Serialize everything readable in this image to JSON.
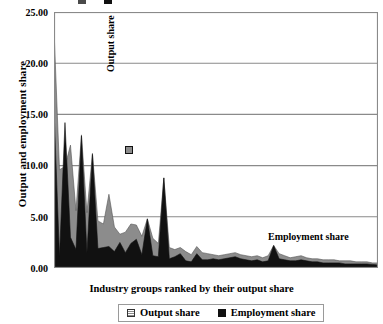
{
  "figure": {
    "top_remnant": {
      "swatch_1_color": "#4a4a4a",
      "swatch_2_color": "#111111"
    }
  },
  "axes": {
    "ylabel": "Output and employment share",
    "xlabel": "Industry groups ranked by their output share",
    "ytick_labels": [
      "25.00",
      "20.00",
      "15.00",
      "10.00",
      "5.00",
      "0.00"
    ]
  },
  "annotations": {
    "output_share": "Output share",
    "employment_share": "Employment share"
  },
  "legend": {
    "items": [
      {
        "label": "Output share",
        "color": "#8c8c8c"
      },
      {
        "label": "Employment share",
        "color": "#111111"
      }
    ]
  },
  "chart_data": {
    "type": "area",
    "title": "",
    "subtitle": "",
    "xlabel": "Industry groups ranked by their output share",
    "ylabel": "Output and employment share",
    "ylim": [
      0,
      25
    ],
    "xlim": [
      0,
      59
    ],
    "ytick_step": 5,
    "ytick_values": [
      0,
      5,
      10,
      15,
      20,
      25
    ],
    "grid": "horizontal",
    "legend_position": "below-plot-center",
    "x": [
      0,
      1,
      2,
      3,
      4,
      5,
      6,
      7,
      8,
      9,
      10,
      11,
      12,
      13,
      14,
      15,
      16,
      17,
      18,
      19,
      20,
      21,
      22,
      23,
      24,
      25,
      26,
      27,
      28,
      29,
      30,
      31,
      32,
      33,
      34,
      35,
      36,
      37,
      38,
      39,
      40,
      41,
      42,
      43,
      44,
      45,
      46,
      47,
      48,
      49,
      50,
      51,
      52,
      53,
      54,
      55,
      56,
      57,
      58,
      59
    ],
    "series": [
      {
        "name": "Output share",
        "color": "#8c8c8c",
        "values": [
          23.3,
          9.6,
          9.9,
          12.0,
          5.6,
          13.0,
          5.4,
          11.2,
          4.6,
          4.3,
          7.2,
          4.0,
          3.3,
          3.5,
          4.3,
          4.2,
          3.1,
          4.8,
          2.9,
          2.4,
          8.8,
          2.0,
          1.8,
          2.0,
          1.6,
          1.3,
          2.1,
          1.5,
          1.4,
          1.3,
          1.2,
          1.3,
          1.4,
          1.5,
          1.3,
          1.2,
          1.1,
          1.2,
          1.0,
          1.2,
          2.2,
          1.4,
          1.2,
          1.0,
          1.1,
          1.2,
          1.0,
          0.9,
          0.9,
          0.8,
          0.8,
          0.8,
          0.7,
          0.7,
          0.7,
          0.6,
          0.6,
          0.6,
          0.5,
          0.5
        ]
      },
      {
        "name": "Employment share",
        "color": "#111111",
        "values": [
          15.5,
          1.1,
          14.2,
          3.0,
          1.8,
          12.9,
          1.5,
          11.1,
          1.9,
          2.0,
          2.1,
          1.6,
          2.5,
          1.5,
          2.4,
          2.8,
          1.3,
          4.8,
          1.2,
          1.1,
          8.8,
          0.9,
          1.1,
          1.4,
          0.7,
          0.6,
          1.4,
          0.8,
          0.8,
          0.9,
          0.8,
          0.9,
          1.0,
          1.1,
          0.9,
          0.8,
          0.7,
          0.8,
          0.6,
          0.7,
          2.2,
          0.9,
          0.8,
          0.7,
          0.7,
          0.8,
          0.7,
          0.6,
          0.6,
          0.5,
          0.5,
          0.5,
          0.5,
          0.4,
          0.4,
          0.4,
          0.4,
          0.4,
          0.35,
          0.3
        ]
      }
    ]
  }
}
